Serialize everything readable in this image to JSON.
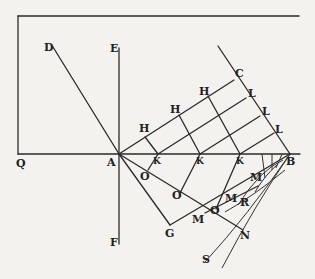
{
  "diagram": {
    "title": "",
    "points": {
      "D": {
        "label": "D",
        "x": 44,
        "y": 43
      },
      "E": {
        "label": "E",
        "x": 110,
        "y": 43
      },
      "Q": {
        "label": "Q",
        "x": 16,
        "y": 157
      },
      "A": {
        "label": "A",
        "x": 108,
        "y": 157
      },
      "F": {
        "label": "F",
        "x": 110,
        "y": 236
      },
      "B": {
        "label": "B",
        "x": 286,
        "y": 156
      },
      "C": {
        "label": "C",
        "x": 235,
        "y": 69
      },
      "G": {
        "label": "G",
        "x": 166,
        "y": 228
      },
      "N": {
        "label": "N",
        "x": 241,
        "y": 232
      },
      "S": {
        "label": "S",
        "x": 202,
        "y": 253
      }
    },
    "labels": {
      "H1": "H",
      "H2": "H",
      "H3": "H",
      "L1": "L",
      "L2": "L",
      "L3": "L",
      "K1": "K",
      "K2": "K",
      "K3": "K",
      "O1": "O",
      "O2": "O",
      "O3": "O",
      "M1": "M",
      "M2": "M",
      "M3": "M",
      "R": "R"
    },
    "stroke_color": "#2a2a2a",
    "background_color": "#f3f2ef"
  }
}
